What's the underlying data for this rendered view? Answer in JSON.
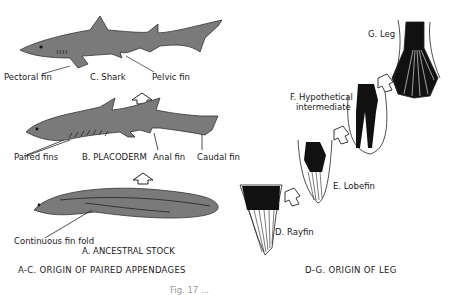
{
  "left_panel": {
    "caption": "A-C. ORIGIN OF PAIRED APPENDAGES",
    "shark": {
      "title": "C. Shark",
      "labels": {
        "pectoral": "Pectoral fin",
        "pelvic": "Pelvic fin"
      }
    },
    "placoderm": {
      "title": "B. PLACODERM",
      "labels": {
        "paired": "Paired fins",
        "anal": "Anal fin",
        "caudal": "Caudal fin"
      }
    },
    "ancestral": {
      "title": "A. ANCESTRAL STOCK",
      "labels": {
        "fold": "Continuous fin fold"
      }
    }
  },
  "right_panel": {
    "caption": "D-G. ORIGIN OF LEG",
    "stages": [
      {
        "label": "D. Rayfin"
      },
      {
        "label": "E. Lobefin"
      },
      {
        "label": "F. Hypothetical intermediate",
        "line1": "F. Hypothetical",
        "line2": "intermediate"
      },
      {
        "label": "G. Leg"
      }
    ]
  },
  "figure_caption_partial": "Fig. 17 ..."
}
